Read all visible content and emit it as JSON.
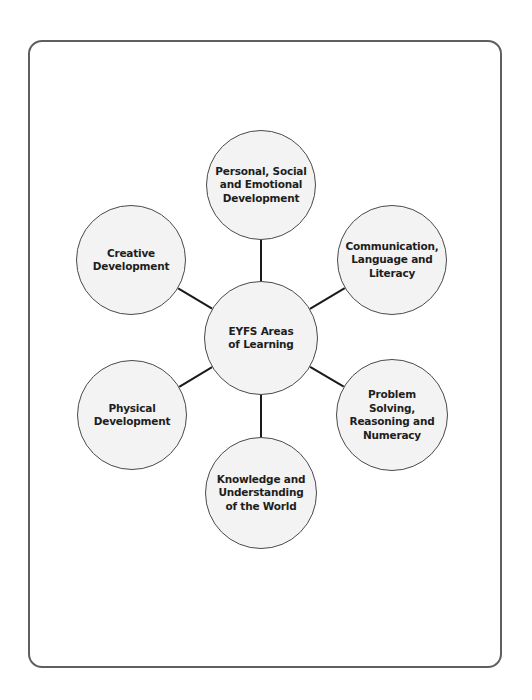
{
  "diagram": {
    "title": "EYFS Areas of Learning",
    "colors": {
      "frame_border": "#5f5f5f",
      "node_fill": "#f3f3f3",
      "node_border": "#4a4a4a",
      "connector": "#1a1a1a",
      "text": "#1e1e1e"
    },
    "center": {
      "id": "eyfs-areas-of-learning",
      "label": "EYFS Areas\nof Learning",
      "cx": 261,
      "cy": 338,
      "r": 57
    },
    "nodes": [
      {
        "id": "personal-social-emotional",
        "label": "Personal, Social\nand Emotional\nDevelopment",
        "cx": 261,
        "cy": 185,
        "r": 55
      },
      {
        "id": "communication-language-literacy",
        "label": "Communication,\nLanguage and\nLiteracy",
        "cx": 392,
        "cy": 260,
        "r": 55
      },
      {
        "id": "problem-solving-reasoning-numeracy",
        "label": "Problem\nSolving,\nReasoning and\nNumeracy",
        "cx": 392,
        "cy": 415,
        "r": 56
      },
      {
        "id": "knowledge-understanding-world",
        "label": "Knowledge and\nUnderstanding\nof the World",
        "cx": 261,
        "cy": 493,
        "r": 56
      },
      {
        "id": "physical-development",
        "label": "Physical\nDevelopment",
        "cx": 132,
        "cy": 415,
        "r": 55
      },
      {
        "id": "creative-development",
        "label": "Creative\nDevelopment",
        "cx": 131,
        "cy": 260,
        "r": 55
      }
    ]
  }
}
